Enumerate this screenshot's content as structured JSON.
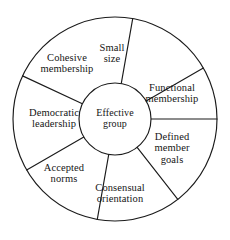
{
  "diagram": {
    "type": "wheel-spoke-diagram",
    "hub": {
      "label": "Effective group",
      "lines": [
        "Effective",
        "group"
      ]
    },
    "geometry": {
      "center_x": 115,
      "center_y": 119,
      "outer_radius": 102,
      "hub_radius": 36,
      "segment_count": 7,
      "stroke_color": "#1b1b1b",
      "background_color": "#ffffff"
    },
    "segments": [
      {
        "id": "small-size",
        "label": "Small size",
        "lines": [
          "Small",
          "size"
        ],
        "start_angle": -80,
        "end_angle": -30,
        "label_x": 112,
        "label_y": 53
      },
      {
        "id": "functional-membership",
        "label": "Functional membership",
        "lines": [
          "Functional",
          "membership"
        ],
        "start_angle": -30,
        "end_angle": 0,
        "label_x": 172,
        "label_y": 93
      },
      {
        "id": "defined-member-goals",
        "label": "Defined member goals",
        "lines": [
          "Defined",
          "member",
          "goals"
        ],
        "start_angle": 0,
        "end_angle": 52,
        "label_x": 172,
        "label_y": 148
      },
      {
        "id": "consensual-orientation",
        "label": "Consensual orientation",
        "lines": [
          "Consensual",
          "orientation"
        ],
        "start_angle": 52,
        "end_angle": 100,
        "label_x": 120,
        "label_y": 193
      },
      {
        "id": "accepted-norms",
        "label": "Accepted norms",
        "lines": [
          "Accepted",
          "norms"
        ],
        "start_angle": 100,
        "end_angle": 150,
        "label_x": 64,
        "label_y": 173
      },
      {
        "id": "democratic-leadership",
        "label": "Democratic leadership",
        "lines": [
          "Democratic",
          "leadership"
        ],
        "start_angle": 150,
        "end_angle": 205,
        "label_x": 54,
        "label_y": 118
      },
      {
        "id": "cohesive-membership",
        "label": "Cohesive membership",
        "lines": [
          "Cohesive",
          "membership"
        ],
        "start_angle": 205,
        "end_angle": 280,
        "label_x": 67,
        "label_y": 63
      }
    ]
  }
}
